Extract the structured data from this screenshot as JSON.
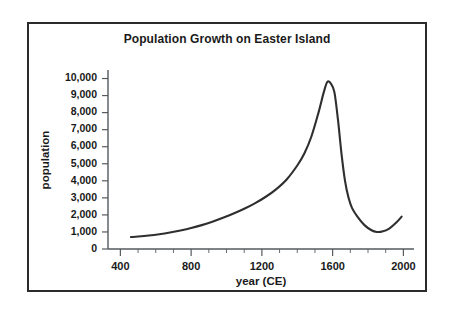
{
  "chart_data": {
    "type": "line",
    "title": "Population Growth on Easter Island",
    "xlabel": "year (CE)",
    "ylabel": "population",
    "xlim": [
      330,
      2060
    ],
    "ylim": [
      0,
      10500
    ],
    "grid": false,
    "legend": "none",
    "xticks": [
      400,
      800,
      1200,
      1600,
      2000
    ],
    "xtick_labels": [
      "400",
      "800",
      "1200",
      "1600",
      "2000"
    ],
    "x_minor_tick_step": 100,
    "yticks": [
      0,
      1000,
      2000,
      3000,
      4000,
      5000,
      6000,
      7000,
      8000,
      9000,
      10000
    ],
    "ytick_labels": [
      "0",
      "1,000",
      "2,000",
      "3,000",
      "4,000",
      "5,000",
      "6,000",
      "7,000",
      "8,000",
      "9,000",
      "10,000"
    ],
    "series": [
      {
        "name": "population",
        "x": [
          460,
          500,
          560,
          620,
          680,
          740,
          800,
          860,
          920,
          980,
          1040,
          1100,
          1160,
          1220,
          1280,
          1340,
          1400,
          1440,
          1480,
          1520,
          1550,
          1570,
          1590,
          1610,
          1630,
          1650,
          1670,
          1690,
          1710,
          1740,
          1780,
          1820,
          1850,
          1880,
          1920,
          1960,
          1990
        ],
        "values": [
          700,
          730,
          790,
          870,
          970,
          1090,
          1230,
          1400,
          1600,
          1830,
          2080,
          2360,
          2680,
          3050,
          3500,
          4080,
          4900,
          5600,
          6600,
          8000,
          9200,
          9800,
          9700,
          9200,
          7600,
          5600,
          4000,
          3000,
          2400,
          1900,
          1400,
          1100,
          1000,
          1020,
          1200,
          1550,
          1900
        ]
      }
    ],
    "annotations": {
      "peak_year": 1570,
      "peak_population": 9800,
      "minimum_year": 1850,
      "minimum_population": 1000,
      "start_year": 460,
      "start_population": 700,
      "end_year": 1990,
      "end_population": 1900
    }
  },
  "colors": {
    "curve": "#2f2f2f",
    "axis": "#555a5c",
    "frame": "#2b2b2b",
    "text": "#1a1a1a",
    "background": "#ffffff"
  }
}
